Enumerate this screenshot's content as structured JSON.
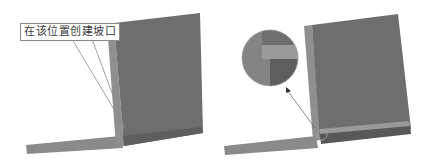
{
  "left_panel": {
    "callout_text": "在该位置创建坡口",
    "description": "3D view of vertical plate on base plate with callout"
  },
  "right_panel": {
    "description": "3D view with bevel created at joint, magnified detail circle and arrow"
  },
  "colors": {
    "plate_face": "#6e6e6e",
    "plate_edge": "#8f8f8f",
    "base_plate": "#8a8a8a",
    "base_dark": "#5c5c5c",
    "bevel_strip": "#9a9a9a",
    "callout_border": "#8a8a8a"
  }
}
